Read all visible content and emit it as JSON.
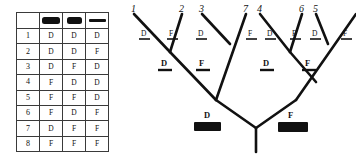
{
  "matrix": {
    "header": {
      "row_label_corner": "",
      "characters": [
        {
          "id": "char-1",
          "icon": "wide-filled-bar-icon"
        },
        {
          "id": "char-2",
          "icon": "medium-filled-bar-icon"
        },
        {
          "id": "char-3",
          "icon": "thin-line-bar-icon"
        }
      ]
    },
    "rows": [
      {
        "label": "1",
        "states": [
          "D",
          "D",
          "D"
        ]
      },
      {
        "label": "2",
        "states": [
          "D",
          "D",
          "F"
        ]
      },
      {
        "label": "3",
        "states": [
          "D",
          "F",
          "D"
        ]
      },
      {
        "label": "4",
        "states": [
          "F",
          "D",
          "D"
        ]
      },
      {
        "label": "5",
        "states": [
          "F",
          "F",
          "D"
        ]
      },
      {
        "label": "6",
        "states": [
          "F",
          "D",
          "F"
        ]
      },
      {
        "label": "7",
        "states": [
          "D",
          "F",
          "F"
        ]
      },
      {
        "label": "8",
        "states": [
          "F",
          "F",
          "F"
        ]
      }
    ]
  },
  "tree": {
    "leaves": [
      {
        "num": "1",
        "state": "D"
      },
      {
        "num": "2",
        "state": "F"
      },
      {
        "num": "3",
        "state": "D"
      },
      {
        "num": "7",
        "state": "F"
      },
      {
        "num": "4",
        "state": "D"
      },
      {
        "num": "6",
        "state": "F"
      },
      {
        "num": "5",
        "state": "D"
      },
      {
        "num": "",
        "state": "F"
      }
    ],
    "internal_states": [
      {
        "id": "node-left-inner",
        "state": "D"
      },
      {
        "id": "node-left-outer",
        "state": "F"
      },
      {
        "id": "node-right-inner",
        "state": "D"
      },
      {
        "id": "node-right-outer",
        "state": "F"
      }
    ],
    "root_states": [
      {
        "id": "root-left",
        "state": "D"
      },
      {
        "id": "root-right",
        "state": "F"
      }
    ],
    "colors": {
      "ink": "#111111",
      "paper": "#ffffff"
    }
  }
}
